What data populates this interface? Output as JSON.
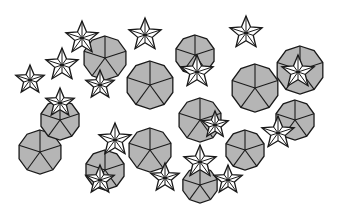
{
  "figure": {
    "colors": {
      "fill_gray": "#b5b5b5",
      "fill_white": "#ffffff",
      "stroke": "#1a1a1a",
      "background": "#ffffff"
    },
    "decagons": [
      {
        "cx": 150,
        "cy": 85,
        "r": 24
      },
      {
        "cx": 40,
        "cy": 152,
        "r": 22
      },
      {
        "cx": 255,
        "cy": 88,
        "r": 24
      },
      {
        "cx": 105,
        "cy": 58,
        "r": 22
      },
      {
        "cx": 200,
        "cy": 120,
        "r": 22
      },
      {
        "cx": 295,
        "cy": 120,
        "r": 20
      },
      {
        "cx": 150,
        "cy": 150,
        "r": 22
      },
      {
        "cx": 60,
        "cy": 120,
        "r": 20
      },
      {
        "cx": 245,
        "cy": 150,
        "r": 20
      },
      {
        "cx": 195,
        "cy": 55,
        "r": 20
      },
      {
        "cx": 300,
        "cy": 70,
        "r": 24
      },
      {
        "cx": 105,
        "cy": 170,
        "r": 20
      },
      {
        "cx": 200,
        "cy": 185,
        "r": 18
      }
    ],
    "stars": [
      {
        "cx": 82,
        "cy": 38,
        "r": 17
      },
      {
        "cx": 145,
        "cy": 35,
        "r": 17
      },
      {
        "cx": 246,
        "cy": 33,
        "r": 17
      },
      {
        "cx": 62,
        "cy": 65,
        "r": 17
      },
      {
        "cx": 30,
        "cy": 80,
        "r": 15
      },
      {
        "cx": 197,
        "cy": 72,
        "r": 17
      },
      {
        "cx": 298,
        "cy": 72,
        "r": 17
      },
      {
        "cx": 60,
        "cy": 103,
        "r": 15
      },
      {
        "cx": 100,
        "cy": 85,
        "r": 15
      },
      {
        "cx": 115,
        "cy": 140,
        "r": 17
      },
      {
        "cx": 200,
        "cy": 162,
        "r": 17
      },
      {
        "cx": 278,
        "cy": 133,
        "r": 17
      },
      {
        "cx": 165,
        "cy": 178,
        "r": 15
      },
      {
        "cx": 100,
        "cy": 180,
        "r": 15
      },
      {
        "cx": 228,
        "cy": 180,
        "r": 15
      },
      {
        "cx": 215,
        "cy": 125,
        "r": 14
      }
    ]
  }
}
